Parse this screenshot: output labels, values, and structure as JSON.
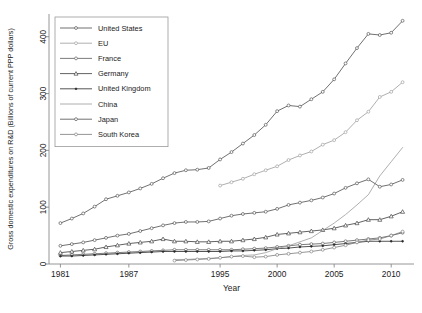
{
  "chart_data": {
    "type": "line",
    "title": "",
    "xlabel": "Year",
    "ylabel": "Gross domestic expenditures on R&D (Billions of current PPP dollars)",
    "xlim": [
      1980,
      2012
    ],
    "ylim": [
      0,
      440
    ],
    "xticks": [
      1981,
      1987,
      1995,
      2000,
      2005,
      2010
    ],
    "xtick_labels": [
      "1981",
      "1987",
      "1995",
      "2000",
      "2005",
      "2010"
    ],
    "yticks": [
      0,
      100,
      200,
      300,
      400
    ],
    "ytick_labels": [
      "0",
      "100",
      "200",
      "300",
      "400"
    ],
    "grid": false,
    "legend_position": "top-left-inside",
    "series": [
      {
        "name": "United States",
        "marker": "circle",
        "color": "#4d4d4d",
        "x": [
          1981,
          1982,
          1983,
          1984,
          1985,
          1986,
          1987,
          1988,
          1989,
          1990,
          1991,
          1992,
          1993,
          1994,
          1995,
          1996,
          1997,
          1998,
          1999,
          2000,
          2001,
          2002,
          2003,
          2004,
          2005,
          2006,
          2007,
          2008,
          2009,
          2010,
          2011
        ],
        "values": [
          72,
          80,
          89,
          101,
          114,
          120,
          126,
          133,
          141,
          151,
          160,
          165,
          166,
          169,
          184,
          197,
          212,
          227,
          245,
          269,
          279,
          277,
          290,
          303,
          325,
          353,
          380,
          405,
          403,
          407,
          428
        ]
      },
      {
        "name": "EU",
        "marker": "circle",
        "color": "#9a9a9a",
        "x": [
          1995,
          1996,
          1997,
          1998,
          1999,
          2000,
          2001,
          2002,
          2003,
          2004,
          2005,
          2006,
          2007,
          2008,
          2009,
          2010,
          2011
        ],
        "values": [
          138,
          144,
          150,
          158,
          165,
          172,
          183,
          191,
          198,
          210,
          218,
          232,
          253,
          268,
          294,
          303,
          320
        ]
      },
      {
        "name": "France",
        "marker": "circle",
        "color": "#5a5a5a",
        "x": [
          1981,
          1982,
          1983,
          1984,
          1985,
          1986,
          1987,
          1988,
          1989,
          1990,
          1991,
          1992,
          1993,
          1994,
          1995,
          1996,
          1997,
          1998,
          1999,
          2000,
          2001,
          2002,
          2003,
          2004,
          2005,
          2006,
          2007,
          2008,
          2009,
          2010,
          2011
        ],
        "values": [
          15,
          16,
          17,
          18,
          19,
          20,
          21,
          22,
          23,
          24,
          25,
          25,
          25,
          25,
          25,
          25,
          26,
          27,
          28,
          30,
          32,
          34,
          35,
          36,
          38,
          40,
          42,
          44,
          46,
          50,
          55
        ]
      },
      {
        "name": "Germany",
        "marker": "triangle",
        "color": "#3a3a3a",
        "x": [
          1981,
          1982,
          1983,
          1984,
          1985,
          1986,
          1987,
          1988,
          1989,
          1990,
          1991,
          1992,
          1993,
          1994,
          1995,
          1996,
          1997,
          1998,
          1999,
          2000,
          2001,
          2002,
          2003,
          2004,
          2005,
          2006,
          2007,
          2008,
          2009,
          2010,
          2011
        ],
        "values": [
          20,
          22,
          24,
          26,
          30,
          33,
          36,
          38,
          40,
          44,
          40,
          40,
          39,
          39,
          40,
          40,
          42,
          44,
          47,
          52,
          54,
          56,
          58,
          60,
          63,
          68,
          72,
          78,
          78,
          84,
          92
        ]
      },
      {
        "name": "United Kingdom",
        "marker": "dot",
        "color": "#2a2a2a",
        "x": [
          1981,
          1982,
          1983,
          1984,
          1985,
          1986,
          1987,
          1988,
          1989,
          1990,
          1991,
          1992,
          1993,
          1994,
          1995,
          1996,
          1997,
          1998,
          1999,
          2000,
          2001,
          2002,
          2003,
          2004,
          2005,
          2006,
          2007,
          2008,
          2009,
          2010,
          2011
        ],
        "values": [
          14,
          14,
          15,
          16,
          17,
          18,
          19,
          20,
          21,
          22,
          22,
          22,
          22,
          22,
          22,
          23,
          23,
          24,
          25,
          27,
          28,
          30,
          31,
          32,
          34,
          36,
          38,
          40,
          40,
          40,
          40
        ]
      },
      {
        "name": "China",
        "marker": "none",
        "color": "#9a9a9a",
        "x": [
          1991,
          1992,
          1993,
          1994,
          1995,
          1996,
          1997,
          1998,
          1999,
          2000,
          2001,
          2002,
          2003,
          2004,
          2005,
          2006,
          2007,
          2008,
          2009,
          2010,
          2011
        ],
        "values": [
          8,
          8,
          9,
          10,
          11,
          13,
          15,
          16,
          20,
          27,
          32,
          39,
          46,
          59,
          72,
          87,
          104,
          122,
          155,
          180,
          205
        ]
      },
      {
        "name": "Japan",
        "marker": "circle",
        "color": "#4d4d4d",
        "x": [
          1981,
          1982,
          1983,
          1984,
          1985,
          1986,
          1987,
          1988,
          1989,
          1990,
          1991,
          1992,
          1993,
          1994,
          1995,
          1996,
          1997,
          1998,
          1999,
          2000,
          2001,
          2002,
          2003,
          2004,
          2005,
          2006,
          2007,
          2008,
          2009,
          2010,
          2011
        ],
        "values": [
          32,
          35,
          38,
          42,
          46,
          50,
          53,
          58,
          63,
          68,
          72,
          74,
          74,
          75,
          80,
          85,
          88,
          90,
          92,
          97,
          104,
          108,
          112,
          117,
          124,
          134,
          142,
          149,
          136,
          140,
          148
        ]
      },
      {
        "name": "South Korea",
        "marker": "circle",
        "color": "#7a7a7a",
        "x": [
          1991,
          1992,
          1993,
          1994,
          1995,
          1996,
          1997,
          1998,
          1999,
          2000,
          2001,
          2002,
          2003,
          2004,
          2005,
          2006,
          2007,
          2008,
          2009,
          2010,
          2011
        ],
        "values": [
          6,
          7,
          8,
          9,
          11,
          13,
          14,
          12,
          13,
          16,
          18,
          20,
          22,
          25,
          29,
          33,
          38,
          42,
          44,
          50,
          57
        ]
      }
    ]
  }
}
